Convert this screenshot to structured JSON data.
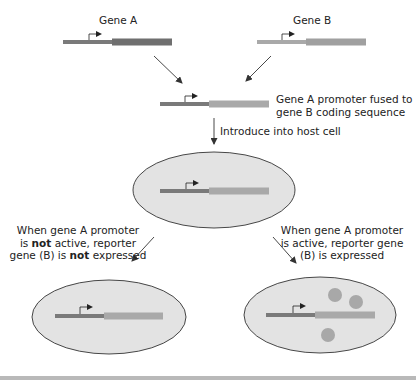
{
  "genes": {
    "gene_a": {
      "label": "Gene A",
      "promoter_color": "#7a7a7a",
      "coding_color": "#6f6f6f"
    },
    "gene_b": {
      "label": "Gene B",
      "promoter_color": "#a9a9a9",
      "coding_color": "#a0a0a0"
    }
  },
  "fusion": {
    "caption_line1": "Gene A promoter fused to",
    "caption_line2": "gene B coding sequence"
  },
  "step": {
    "introduce_label": "Introduce into host cell"
  },
  "outcomes": {
    "not_active": {
      "line1": "When gene A promoter",
      "line2_pre": "is ",
      "line2_bold": "not",
      "line2_post": " active, reporter",
      "line3_pre": "gene (B) is ",
      "line3_bold": "not",
      "line3_post": " expressed"
    },
    "active": {
      "line1": "When gene A promoter",
      "line2": "is active, reporter gene",
      "line3": "(B) is expressed"
    }
  },
  "colors": {
    "cell_fill": "#e3e3e3",
    "cell_stroke": "#333333",
    "protein": "#a8a8a8",
    "arrow": "#333333"
  }
}
